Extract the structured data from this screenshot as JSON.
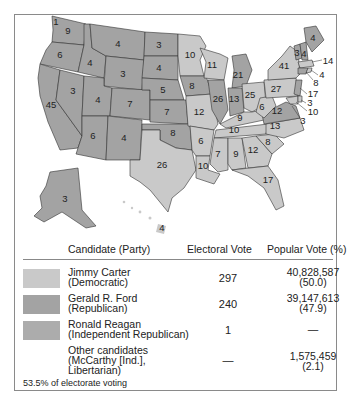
{
  "colors": {
    "carter": "#c9c9c9",
    "ford": "#a3a3a3",
    "reagan": "#acacac",
    "state_border": "#333333",
    "frame": "#8a8a8a"
  },
  "map": {
    "title": "1976 Presidential Election",
    "state_labels": [
      {
        "state": "WA",
        "ev": "9",
        "winner": "ford"
      },
      {
        "state": "WA-faithless",
        "ev": "1",
        "winner": "reagan"
      },
      {
        "state": "OR",
        "ev": "6",
        "winner": "ford"
      },
      {
        "state": "CA",
        "ev": "45",
        "winner": "ford"
      },
      {
        "state": "ID",
        "ev": "4",
        "winner": "ford"
      },
      {
        "state": "NV",
        "ev": "3",
        "winner": "ford"
      },
      {
        "state": "MT",
        "ev": "4",
        "winner": "ford"
      },
      {
        "state": "WY",
        "ev": "3",
        "winner": "ford"
      },
      {
        "state": "UT",
        "ev": "4",
        "winner": "ford"
      },
      {
        "state": "CO",
        "ev": "7",
        "winner": "ford"
      },
      {
        "state": "AZ",
        "ev": "6",
        "winner": "ford"
      },
      {
        "state": "NM",
        "ev": "4",
        "winner": "ford"
      },
      {
        "state": "ND",
        "ev": "3",
        "winner": "ford"
      },
      {
        "state": "SD",
        "ev": "4",
        "winner": "ford"
      },
      {
        "state": "NE",
        "ev": "5",
        "winner": "ford"
      },
      {
        "state": "KS",
        "ev": "7",
        "winner": "ford"
      },
      {
        "state": "OK",
        "ev": "8",
        "winner": "ford"
      },
      {
        "state": "TX",
        "ev": "26",
        "winner": "carter"
      },
      {
        "state": "MN",
        "ev": "10",
        "winner": "carter"
      },
      {
        "state": "IA",
        "ev": "8",
        "winner": "ford"
      },
      {
        "state": "MO",
        "ev": "12",
        "winner": "carter"
      },
      {
        "state": "AR",
        "ev": "6",
        "winner": "carter"
      },
      {
        "state": "LA",
        "ev": "10",
        "winner": "carter"
      },
      {
        "state": "WI",
        "ev": "11",
        "winner": "carter"
      },
      {
        "state": "IL",
        "ev": "26",
        "winner": "ford"
      },
      {
        "state": "MI",
        "ev": "21",
        "winner": "ford"
      },
      {
        "state": "IN",
        "ev": "13",
        "winner": "ford"
      },
      {
        "state": "OH",
        "ev": "25",
        "winner": "carter"
      },
      {
        "state": "KY",
        "ev": "9",
        "winner": "carter"
      },
      {
        "state": "TN",
        "ev": "10",
        "winner": "carter"
      },
      {
        "state": "MS",
        "ev": "7",
        "winner": "carter"
      },
      {
        "state": "AL",
        "ev": "9",
        "winner": "carter"
      },
      {
        "state": "GA",
        "ev": "12",
        "winner": "carter"
      },
      {
        "state": "FL",
        "ev": "17",
        "winner": "carter"
      },
      {
        "state": "SC",
        "ev": "8",
        "winner": "carter"
      },
      {
        "state": "NC",
        "ev": "13",
        "winner": "carter"
      },
      {
        "state": "VA",
        "ev": "12",
        "winner": "ford"
      },
      {
        "state": "WV",
        "ev": "6",
        "winner": "carter"
      },
      {
        "state": "PA",
        "ev": "27",
        "winner": "carter"
      },
      {
        "state": "NY",
        "ev": "41",
        "winner": "carter"
      },
      {
        "state": "VT",
        "ev": "3",
        "winner": "ford"
      },
      {
        "state": "NH",
        "ev": "4",
        "winner": "ford"
      },
      {
        "state": "ME",
        "ev": "4",
        "winner": "ford"
      },
      {
        "state": "MA",
        "ev": "14",
        "winner": "carter"
      },
      {
        "state": "RI",
        "ev": "4",
        "winner": "carter"
      },
      {
        "state": "CT",
        "ev": "8",
        "winner": "ford"
      },
      {
        "state": "NJ",
        "ev": "17",
        "winner": "ford"
      },
      {
        "state": "DE",
        "ev": "3",
        "winner": "carter"
      },
      {
        "state": "MD",
        "ev": "10",
        "winner": "carter"
      },
      {
        "state": "DC",
        "ev": "3",
        "winner": "carter"
      },
      {
        "state": "AK",
        "ev": "3",
        "winner": "ford"
      },
      {
        "state": "HI",
        "ev": "4",
        "winner": "carter"
      }
    ]
  },
  "table": {
    "headers": {
      "candidate": "Candidate (Party)",
      "electoral": "Electoral Vote",
      "popular": "Popular Vote (%)"
    },
    "rows": [
      {
        "name": "Jimmy Carter",
        "party": "(Democratic)",
        "electoral": "297",
        "popular": "40,828,587",
        "percent": "(50.0)",
        "swatch": "carter"
      },
      {
        "name": "Gerald R. Ford",
        "party": "(Republican)",
        "electoral": "240",
        "popular": "39,147,613",
        "percent": "(47.9)",
        "swatch": "ford"
      },
      {
        "name": "Ronald Reagan",
        "party": "(Independent Republican)",
        "electoral": "1",
        "popular": "—",
        "percent": "",
        "swatch": "reagan"
      },
      {
        "name": "Other candidates",
        "party": "(McCarthy [Ind.],",
        "party2": "Libertarian)",
        "electoral": "—",
        "popular": "1,575,459",
        "percent": "(2.1)",
        "swatch": "none"
      }
    ]
  },
  "footnote": "53.5% of electorate voting"
}
